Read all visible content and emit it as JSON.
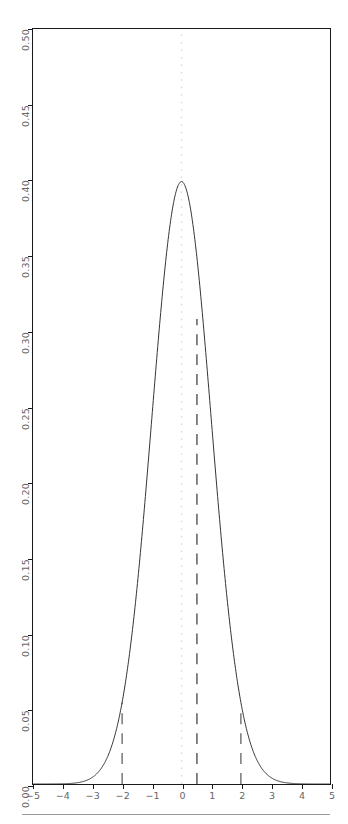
{
  "chart_data": {
    "type": "line",
    "title": "",
    "subtitle": "",
    "xlabel": "",
    "ylabel": "",
    "xlim": [
      -5,
      5
    ],
    "ylim": [
      0.0,
      0.5
    ],
    "grid": false,
    "legend": null,
    "x_ticks": [
      -5,
      -4,
      -3,
      -2,
      -1,
      0,
      1,
      2,
      3,
      4,
      5
    ],
    "x_tick_labels": [
      "-5",
      "-4",
      "-3",
      "-2",
      "-1",
      "0",
      "1",
      "2",
      "3",
      "4",
      "5"
    ],
    "y_ticks": [
      0.0,
      0.05,
      0.1,
      0.15,
      0.2,
      0.25,
      0.3,
      0.35,
      0.4,
      0.45,
      0.5
    ],
    "y_tick_labels": [
      "0.00",
      "0.05",
      "0.10",
      "0.15",
      "0.20",
      "0.25",
      "0.30",
      "0.35",
      "0.40",
      "0.45",
      "0.50"
    ],
    "series": [
      {
        "name": "standard normal density",
        "type": "line",
        "color": "#333333",
        "linestyle": "solid",
        "linewidth": 1.0,
        "x": [
          -5.0,
          -4.75,
          -4.5,
          -4.25,
          -4.0,
          -3.75,
          -3.5,
          -3.25,
          -3.0,
          -2.75,
          -2.5,
          -2.25,
          -2.0,
          -1.75,
          -1.5,
          -1.25,
          -1.0,
          -0.75,
          -0.5,
          -0.25,
          0.0,
          0.25,
          0.5,
          0.75,
          1.0,
          1.25,
          1.5,
          1.75,
          2.0,
          2.25,
          2.5,
          2.75,
          3.0,
          3.25,
          3.5,
          3.75,
          4.0,
          4.25,
          4.5,
          4.75,
          5.0
        ],
        "y": [
          1.5e-06,
          5.1e-06,
          1.6e-05,
          4.65e-05,
          0.0001338,
          0.0003456,
          0.0008727,
          0.0020328,
          0.0044318,
          0.0090936,
          0.0175283,
          0.031652,
          0.053991,
          0.0862773,
          0.1295176,
          0.1826491,
          0.2419707,
          0.3011374,
          0.3520653,
          0.3866681,
          0.3989423,
          0.3866681,
          0.3520653,
          0.3011374,
          0.2419707,
          0.1826491,
          0.1295176,
          0.0862773,
          0.053991,
          0.031652,
          0.0175283,
          0.0090936,
          0.0044318,
          0.0020328,
          0.0008727,
          0.0003456,
          0.0001338,
          4.65e-05,
          1.6e-05,
          5.1e-06,
          1.5e-06
        ]
      }
    ],
    "vlines": [
      {
        "name": "mean-line",
        "x": 0.0,
        "linestyle": "dotted",
        "color": "#d8d8d8",
        "y_from": 0.0,
        "y_to": 0.5
      },
      {
        "name": "lower-bound-line",
        "x": -2.0,
        "linestyle": "dashed",
        "color": "#555555",
        "y_from": 0.0,
        "y_to": 0.054
      },
      {
        "name": "observed-line",
        "x": 0.52,
        "linestyle": "dashed",
        "color": "#333333",
        "y_from": 0.0,
        "y_to": 0.308
      },
      {
        "name": "upper-bound-line",
        "x": 2.0,
        "linestyle": "dashed",
        "color": "#555555",
        "y_from": 0.0,
        "y_to": 0.048
      }
    ]
  }
}
